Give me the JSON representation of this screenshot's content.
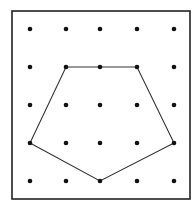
{
  "diagram": {
    "type": "geoboard-dot-grid",
    "grid": {
      "rows": 5,
      "cols": 5,
      "col_x": [
        30,
        66,
        100,
        137,
        174
      ],
      "row_y": [
        29,
        67,
        105,
        143,
        181
      ]
    },
    "polygon": {
      "shape": "pentagon",
      "vertices_grid": [
        [
          1,
          1
        ],
        [
          3,
          1
        ],
        [
          4,
          3
        ],
        [
          2,
          4
        ],
        [
          0,
          3
        ]
      ],
      "stroke_color": "#333333"
    },
    "frame": {
      "x": 12,
      "y": 11,
      "width": 178,
      "height": 188,
      "stroke_color": "#222222"
    },
    "dot_color": "#111111"
  }
}
